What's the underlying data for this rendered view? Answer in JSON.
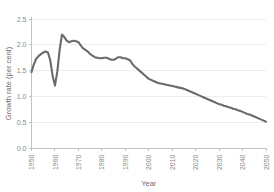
{
  "chart_data": {
    "type": "line",
    "title": "",
    "xlabel": "Year",
    "ylabel": "Growth rate (per cent)",
    "xlim": [
      1950,
      2050
    ],
    "ylim": [
      0.0,
      2.5
    ],
    "grid": true,
    "legend": false,
    "legend_position": "none",
    "line_color": "#6b6b6b",
    "gridline_color": "#e9e9e9",
    "axis_color": "#bdbdbd",
    "tick_label_color": "#8a8a8a",
    "background_color": "#ffffff",
    "xticks": [
      1950,
      1960,
      1970,
      1980,
      1990,
      2000,
      2010,
      2020,
      2030,
      2040,
      2050
    ],
    "xtick_labels": [
      "1950",
      "1960",
      "1970",
      "1980",
      "1990",
      "2000",
      "2010",
      "2020",
      "2030",
      "2040",
      "2050"
    ],
    "yticks": [
      0.0,
      0.5,
      1.0,
      1.5,
      2.0,
      2.5
    ],
    "ytick_labels": [
      "0.0",
      "0.5",
      "1.0",
      "1.5",
      "2.0",
      "2.5"
    ],
    "series": [
      {
        "name": "World population growth rate",
        "x": [
          1950,
          1951,
          1952,
          1953,
          1954,
          1955,
          1956,
          1957,
          1958,
          1959,
          1960,
          1961,
          1962,
          1963,
          1964,
          1965,
          1966,
          1967,
          1968,
          1969,
          1970,
          1971,
          1972,
          1973,
          1974,
          1975,
          1976,
          1977,
          1978,
          1979,
          1980,
          1981,
          1982,
          1983,
          1984,
          1985,
          1986,
          1987,
          1988,
          1989,
          1990,
          1991,
          1992,
          1993,
          1994,
          1995,
          1996,
          1997,
          1998,
          1999,
          2000,
          2001,
          2002,
          2003,
          2004,
          2005,
          2006,
          2007,
          2008,
          2009,
          2010,
          2011,
          2012,
          2013,
          2014,
          2015,
          2016,
          2017,
          2018,
          2019,
          2020,
          2021,
          2022,
          2023,
          2024,
          2025,
          2026,
          2027,
          2028,
          2029,
          2030,
          2031,
          2032,
          2033,
          2034,
          2035,
          2036,
          2037,
          2038,
          2039,
          2040,
          2041,
          2042,
          2043,
          2044,
          2045,
          2046,
          2047,
          2048,
          2049,
          2050
        ],
        "values": [
          1.47,
          1.62,
          1.73,
          1.78,
          1.82,
          1.85,
          1.87,
          1.85,
          1.7,
          1.4,
          1.21,
          1.48,
          1.9,
          2.2,
          2.15,
          2.08,
          2.05,
          2.07,
          2.08,
          2.07,
          2.05,
          1.99,
          1.93,
          1.9,
          1.87,
          1.82,
          1.79,
          1.76,
          1.75,
          1.74,
          1.74,
          1.75,
          1.75,
          1.73,
          1.71,
          1.71,
          1.73,
          1.76,
          1.76,
          1.74,
          1.74,
          1.72,
          1.7,
          1.63,
          1.58,
          1.54,
          1.5,
          1.46,
          1.42,
          1.38,
          1.34,
          1.32,
          1.3,
          1.28,
          1.26,
          1.25,
          1.24,
          1.23,
          1.22,
          1.21,
          1.2,
          1.19,
          1.18,
          1.17,
          1.16,
          1.15,
          1.13,
          1.11,
          1.09,
          1.07,
          1.05,
          1.03,
          1.01,
          0.99,
          0.97,
          0.95,
          0.93,
          0.91,
          0.89,
          0.87,
          0.85,
          0.84,
          0.82,
          0.81,
          0.79,
          0.78,
          0.76,
          0.75,
          0.73,
          0.72,
          0.7,
          0.68,
          0.66,
          0.65,
          0.63,
          0.61,
          0.59,
          0.57,
          0.55,
          0.53,
          0.51
        ]
      }
    ]
  }
}
